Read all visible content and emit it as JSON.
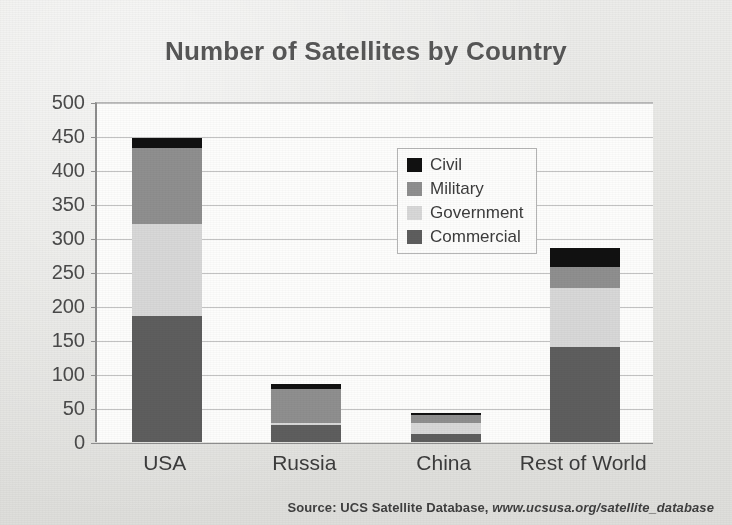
{
  "chart_data": {
    "type": "bar",
    "subtype": "stacked-bar",
    "title": "Number of Satellites by Country",
    "xlabel": "",
    "ylabel": "",
    "ylim": [
      0,
      500
    ],
    "ytick_step": 50,
    "yticks": [
      500,
      450,
      400,
      350,
      300,
      250,
      200,
      150,
      100,
      50,
      0
    ],
    "grid": true,
    "legend_position": "inside-upper-center",
    "categories": [
      "USA",
      "Russia",
      "China",
      "Rest of World"
    ],
    "stack_order_bottom_to_top": [
      "Commercial",
      "Government",
      "Military",
      "Civil"
    ],
    "series": [
      {
        "name": "Civil",
        "color": "#111111",
        "values": [
          15,
          7,
          3,
          28
        ]
      },
      {
        "name": "Military",
        "color": "#8f8f8f",
        "values": [
          112,
          50,
          12,
          30
        ]
      },
      {
        "name": "Government",
        "color": "#d8d8d8",
        "values": [
          135,
          3,
          16,
          88
        ]
      },
      {
        "name": "Commercial",
        "color": "#5e5e5e",
        "values": [
          185,
          25,
          12,
          139
        ]
      }
    ],
    "totals": [
      447,
      85,
      43,
      285
    ],
    "source": "Source: UCS Satellite Database, www.ucsusa.org/satellite_database",
    "source_prefix": "Source: UCS Satellite Database, ",
    "source_url": "www.ucsusa.org/satellite_database"
  },
  "colors": {
    "civil": "#111111",
    "military": "#8f8f8f",
    "government": "#d8d8d8",
    "commercial": "#5e5e5e",
    "title": "#575757",
    "plot_background": "#fdfdfc",
    "page_background": "#e8e8e6",
    "axis": "#8d8d8d",
    "gridline": "#c2c2c2"
  }
}
